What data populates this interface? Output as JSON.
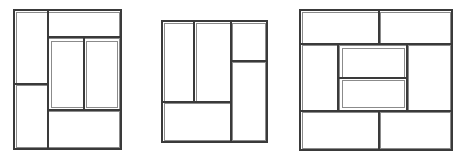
{
  "meta": {
    "background_color": "#ffffff",
    "stroke_color": "#3a3a3a",
    "stroke_color_light": "#6e6e6e",
    "canvas_width": 463,
    "canvas_height": 161,
    "figure_count": 3,
    "drawing_type": "rectangular-partition-line-drawings"
  },
  "chart_data": {
    "type": "table",
    "title": "",
    "xlabel": "",
    "ylabel": "",
    "figures": [
      {
        "id": "figure-1",
        "label": "",
        "outer": {
          "x": 14,
          "y": 10,
          "width": 107,
          "height": 139,
          "stroke": "#3a3a3a",
          "stroke_width": 1.2
        },
        "rects": [
          {
            "name": "left-upper-cell",
            "x": 16,
            "y": 12,
            "width": 31,
            "height": 72
          },
          {
            "name": "left-lower-cell",
            "x": 16,
            "y": 85,
            "width": 31,
            "height": 62
          },
          {
            "name": "right-upper-band",
            "x": 48,
            "y": 12,
            "width": 71,
            "height": 25
          },
          {
            "name": "inner-box",
            "x": 48,
            "y": 38,
            "width": 71,
            "height": 72
          },
          {
            "name": "inner-left-cell",
            "x": 51,
            "y": 41,
            "width": 32,
            "height": 66
          },
          {
            "name": "inner-right-cell",
            "x": 86,
            "y": 41,
            "width": 31,
            "height": 66
          },
          {
            "name": "right-lower-band",
            "x": 48,
            "y": 111,
            "width": 71,
            "height": 36
          }
        ],
        "lines": [
          {
            "name": "left-column-divider",
            "x1": 48,
            "y1": 10,
            "x2": 48,
            "y2": 149
          },
          {
            "name": "left-horizontal-divider",
            "x1": 14,
            "y1": 84,
            "x2": 48,
            "y2": 84
          },
          {
            "name": "upper-band-bottom",
            "x1": 48,
            "y1": 37,
            "x2": 121,
            "y2": 37
          },
          {
            "name": "inner-box-bottom",
            "x1": 48,
            "y1": 110,
            "x2": 121,
            "y2": 110
          },
          {
            "name": "inner-vertical-divider",
            "x1": 84,
            "y1": 38,
            "x2": 84,
            "y2": 110
          }
        ]
      },
      {
        "id": "figure-2",
        "label": "",
        "outer": {
          "x": 162,
          "y": 21,
          "width": 105,
          "height": 121,
          "stroke": "#3a3a3a",
          "stroke_width": 1.2
        },
        "rects": [
          {
            "name": "left-tall-cell",
            "x": 164,
            "y": 23,
            "width": 29,
            "height": 78
          },
          {
            "name": "middle-tall-cell",
            "x": 196,
            "y": 23,
            "width": 34,
            "height": 78
          },
          {
            "name": "bottom-left-band",
            "x": 164,
            "y": 103,
            "width": 66,
            "height": 37
          },
          {
            "name": "right-upper-cell",
            "x": 232,
            "y": 23,
            "width": 33,
            "height": 37
          },
          {
            "name": "right-lower-cell",
            "x": 232,
            "y": 62,
            "width": 33,
            "height": 78
          }
        ],
        "lines": [
          {
            "name": "left-vertical-divider",
            "x1": 194,
            "y1": 21,
            "x2": 194,
            "y2": 102
          },
          {
            "name": "right-column-divider",
            "x1": 231,
            "y1": 21,
            "x2": 231,
            "y2": 142
          },
          {
            "name": "bottom-band-top",
            "x1": 162,
            "y1": 102,
            "x2": 231,
            "y2": 102
          },
          {
            "name": "right-horizontal-divider",
            "x1": 231,
            "y1": 61,
            "x2": 267,
            "y2": 61
          }
        ]
      },
      {
        "id": "figure-3",
        "label": "",
        "outer": {
          "x": 300,
          "y": 10,
          "width": 152,
          "height": 140,
          "stroke": "#3a3a3a",
          "stroke_width": 1.2
        },
        "rects": [
          {
            "name": "top-left-band",
            "x": 302,
            "y": 12,
            "width": 76,
            "height": 31
          },
          {
            "name": "top-right-band",
            "x": 380,
            "y": 12,
            "width": 70,
            "height": 31
          },
          {
            "name": "middle-left-cell",
            "x": 302,
            "y": 45,
            "width": 35,
            "height": 65
          },
          {
            "name": "middle-right-cell",
            "x": 408,
            "y": 45,
            "width": 42,
            "height": 65
          },
          {
            "name": "inner-box",
            "x": 339,
            "y": 45,
            "width": 68,
            "height": 65
          },
          {
            "name": "inner-upper-cell",
            "x": 342,
            "y": 48,
            "width": 62,
            "height": 29
          },
          {
            "name": "inner-lower-cell",
            "x": 342,
            "y": 80,
            "width": 62,
            "height": 27
          },
          {
            "name": "bottom-left-band",
            "x": 302,
            "y": 112,
            "width": 76,
            "height": 36
          },
          {
            "name": "bottom-right-band",
            "x": 380,
            "y": 112,
            "width": 70,
            "height": 36
          }
        ],
        "lines": [
          {
            "name": "top-band-bottom",
            "x1": 300,
            "y1": 44,
            "x2": 452,
            "y2": 44
          },
          {
            "name": "top-band-divider",
            "x1": 379,
            "y1": 10,
            "x2": 379,
            "y2": 44
          },
          {
            "name": "bottom-band-top",
            "x1": 300,
            "y1": 111,
            "x2": 452,
            "y2": 111
          },
          {
            "name": "bottom-band-divider",
            "x1": 379,
            "y1": 111,
            "x2": 379,
            "y2": 150
          },
          {
            "name": "inner-box-left",
            "x1": 338,
            "y1": 44,
            "x2": 338,
            "y2": 111
          },
          {
            "name": "inner-box-right",
            "x1": 407,
            "y1": 44,
            "x2": 407,
            "y2": 111
          },
          {
            "name": "inner-horizontal-divider",
            "x1": 339,
            "y1": 78,
            "x2": 407,
            "y2": 78
          }
        ]
      }
    ]
  }
}
